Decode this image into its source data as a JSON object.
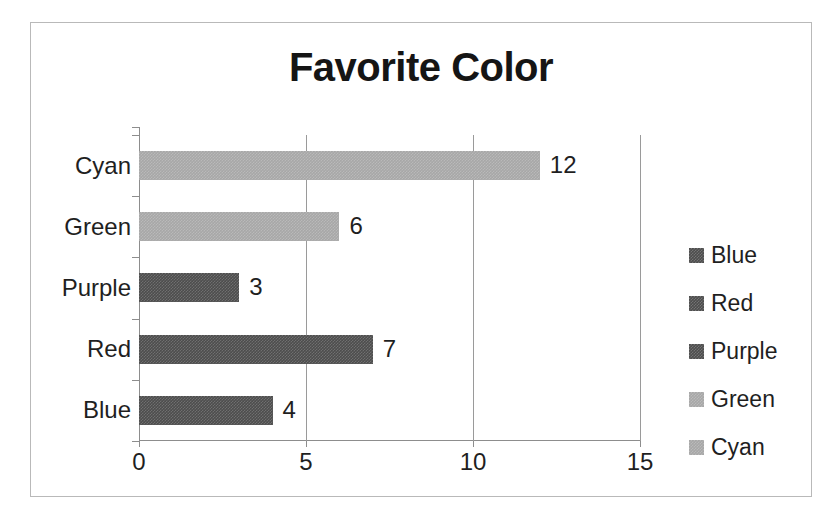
{
  "chart_data": {
    "type": "bar",
    "orientation": "horizontal",
    "title": "Favorite Color",
    "xlabel": "",
    "ylabel": "",
    "categories": [
      "Blue",
      "Red",
      "Purple",
      "Green",
      "Cyan"
    ],
    "values": [
      4,
      7,
      3,
      6,
      12
    ],
    "data_labels": [
      "4",
      "7",
      "3",
      "6",
      "12"
    ],
    "xlim": [
      0,
      15
    ],
    "xticks": [
      0,
      5,
      10,
      15
    ],
    "xtick_labels": [
      "0",
      "5",
      "10",
      "15"
    ],
    "ytick_labels_top_to_bottom": [
      "Cyan",
      "Green",
      "Purple",
      "Red",
      "Blue"
    ],
    "grid": "vertical",
    "legend": {
      "position": "right",
      "entries": [
        {
          "label": "Blue",
          "swatch": "#4d4d4d",
          "tone": "dark"
        },
        {
          "label": "Red",
          "swatch": "#4d4d4d",
          "tone": "dark"
        },
        {
          "label": "Purple",
          "swatch": "#4d4d4d",
          "tone": "dark"
        },
        {
          "label": "Green",
          "swatch": "#a7a7a7",
          "tone": "light"
        },
        {
          "label": "Cyan",
          "swatch": "#a7a7a7",
          "tone": "light"
        }
      ]
    },
    "series_styles": [
      {
        "name": "Blue",
        "fill": "#4d4d4d"
      },
      {
        "name": "Red",
        "fill": "#4d4d4d"
      },
      {
        "name": "Purple",
        "fill": "#4d4d4d"
      },
      {
        "name": "Green",
        "fill": "#a7a7a7"
      },
      {
        "name": "Cyan",
        "fill": "#a7a7a7"
      }
    ],
    "colors": {
      "plot_border": "#b9b9b9",
      "axis": "#8d8d8d",
      "gridline": "#9a9a9a",
      "text": "#1f1f1f",
      "title_text": "#151515",
      "background": "#ffffff"
    }
  }
}
